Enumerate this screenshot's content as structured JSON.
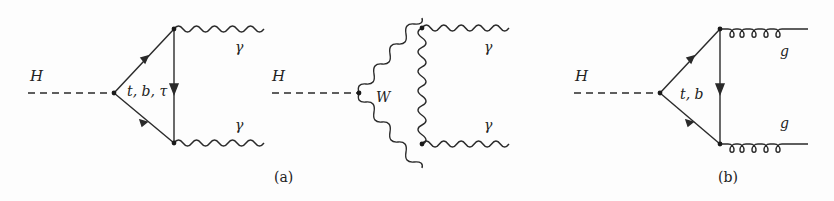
{
  "figure": {
    "panels": [
      {
        "id": "a-fermion-loop",
        "scalar_label": "H",
        "loop_label": "t, b, τ",
        "loop_type": "fermion",
        "outgoing": [
          {
            "label": "γ",
            "type": "photon"
          },
          {
            "label": "γ",
            "type": "photon"
          }
        ]
      },
      {
        "id": "a-w-loop",
        "scalar_label": "H",
        "loop_label": "W",
        "loop_type": "boson",
        "outgoing": [
          {
            "label": "γ",
            "type": "photon"
          },
          {
            "label": "γ",
            "type": "photon"
          }
        ]
      },
      {
        "id": "b-fermion-loop",
        "scalar_label": "H",
        "loop_label": "t, b",
        "loop_type": "fermion",
        "outgoing": [
          {
            "label": "g",
            "type": "gluon"
          },
          {
            "label": "g",
            "type": "gluon"
          }
        ]
      }
    ],
    "captions": [
      "(a)",
      "(b)"
    ],
    "line_color": "#2a2a2a"
  }
}
